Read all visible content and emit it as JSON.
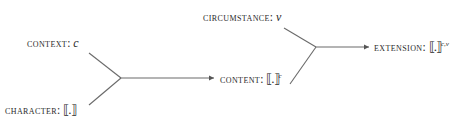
{
  "diagram": {
    "type": "semantic-composition-flow",
    "nodes": {
      "context": {
        "label": "CONTEXT:",
        "value": "c"
      },
      "character": {
        "label": "CHARACTER:",
        "value": "⟦.⟧"
      },
      "content": {
        "label": "CONTENT:",
        "value": "⟦.⟧",
        "superscript": "c"
      },
      "circumstance": {
        "label": "CIRCUMSTANCE:",
        "value": "v"
      },
      "extension": {
        "label": "EXTENSION:",
        "value": "⟦.⟧",
        "superscript": "c,v"
      }
    },
    "edges": [
      {
        "from": [
          "context",
          "character"
        ],
        "to": "content"
      },
      {
        "from": [
          "circumstance",
          "content"
        ],
        "to": "extension"
      }
    ],
    "colors": {
      "line": "#666666",
      "text": "#2a2a2a",
      "background": "#ffffff"
    }
  }
}
